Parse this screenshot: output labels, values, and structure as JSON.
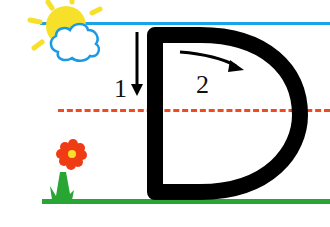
{
  "worksheet": {
    "letter": "D",
    "steps": [
      {
        "number": "1",
        "direction": "down"
      },
      {
        "number": "2",
        "direction": "curve-right"
      }
    ]
  },
  "colors": {
    "top_line": "#1aa3e8",
    "mid_line": "#f04a1e",
    "base_line": "#28a532",
    "letter": "#000000",
    "sun": "#f7e02a",
    "cloud_outline": "#1a9ae6",
    "flower_petals": "#f03c14",
    "flower_center": "#f7e02a",
    "stem": "#28a532"
  }
}
